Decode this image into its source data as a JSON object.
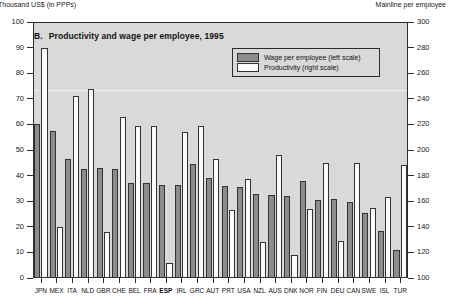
{
  "axes": {
    "left_caption": "Thousand US$ (in PPPs)",
    "right_caption": "Mainline per employee"
  },
  "title": {
    "letter": "B.",
    "text": "Productivity and wage per employee, 1995"
  },
  "legend": {
    "position": "inside-top-right",
    "items": [
      {
        "label": "Wage per employee (left scale)",
        "color": "#8c8c8c"
      },
      {
        "label": "Productivity (right scale)",
        "color": "#fbfbfb"
      }
    ]
  },
  "chart_data": {
    "type": "bar",
    "xlabel": "",
    "ylabel": "Thousand US$ (in PPPs)",
    "y2label": "Mainline per employee",
    "ylim": [
      0,
      100
    ],
    "y2lim": [
      100,
      300
    ],
    "yticks": [
      0,
      10,
      20,
      30,
      40,
      50,
      60,
      70,
      80,
      90,
      100
    ],
    "y2ticks": [
      100,
      120,
      140,
      160,
      180,
      200,
      220,
      240,
      260,
      280,
      300
    ],
    "grid": false,
    "highlight_category": "ESP",
    "categories": [
      "JPN",
      "MEX",
      "ITA",
      "NLD",
      "GBR",
      "CHE",
      "BEL",
      "FRA",
      "ESP",
      "IRL",
      "GRC",
      "AUT",
      "PRT",
      "USA",
      "NZL",
      "AUS",
      "DNK",
      "NOR",
      "FIN",
      "DEU",
      "CAN",
      "SWE",
      "ISL",
      "TUR"
    ],
    "series": [
      {
        "name": "Wage per employee (left scale)",
        "axis": "left",
        "unit": "thousand US$ (PPP)",
        "values": [
          60,
          57.5,
          46.5,
          42.5,
          43,
          42.5,
          37,
          37,
          36.5,
          36.5,
          44.5,
          39,
          36,
          35.5,
          33,
          32.5,
          32,
          38,
          30.5,
          31,
          29.5,
          25.5,
          18.5,
          11
        ]
      },
      {
        "name": "Productivity (right scale)",
        "axis": "right",
        "unit": "mainline per employee",
        "values": [
          280,
          140,
          242,
          248,
          136,
          226,
          219,
          219,
          112,
          214,
          219,
          193,
          153,
          177,
          128,
          196,
          118,
          154,
          190,
          129,
          190,
          155,
          163,
          188
        ]
      }
    ]
  }
}
